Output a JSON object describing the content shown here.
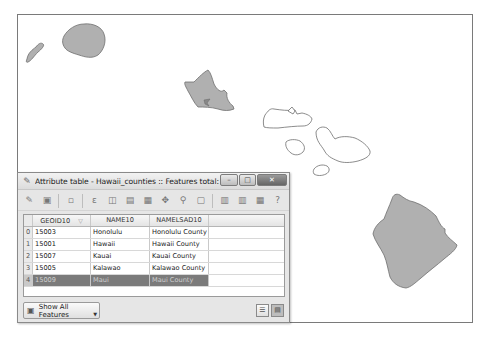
{
  "map": {
    "layer_name": "Hawaii_counties",
    "fill_color": "#b0b0b0",
    "selected_fill_color": "#ffffff",
    "outline_color": "#6e6e6e",
    "islands": [
      {
        "name": "Niihau",
        "selected": false
      },
      {
        "name": "Kauai",
        "selected": false
      },
      {
        "name": "Oahu",
        "selected": false
      },
      {
        "name": "Molokai",
        "selected": true
      },
      {
        "name": "Lanai",
        "selected": true
      },
      {
        "name": "Maui",
        "selected": true
      },
      {
        "name": "Kahoolawe",
        "selected": true
      },
      {
        "name": "Hawaii",
        "selected": false
      }
    ]
  },
  "attribute_window": {
    "title": "Attribute table - Hawaii_counties :: Features total: 5, filtere...",
    "title_icon": "pencil-table-icon",
    "controls": {
      "minimize": "–",
      "maximize": "□",
      "close": "✕"
    },
    "toolbar": [
      {
        "name": "toggle-editing",
        "glyph": "✎"
      },
      {
        "name": "save-edits",
        "glyph": "▣"
      },
      {
        "sep": true
      },
      {
        "name": "delete-selected",
        "glyph": "▫"
      },
      {
        "sep": true
      },
      {
        "name": "expression-select",
        "glyph": "ε"
      },
      {
        "name": "deselect-all",
        "glyph": "◫"
      },
      {
        "name": "move-selection-top",
        "glyph": "▤"
      },
      {
        "name": "invert-selection",
        "glyph": "▦"
      },
      {
        "name": "pan-to-selected",
        "glyph": "✥"
      },
      {
        "name": "zoom-to-selected",
        "glyph": "⚲"
      },
      {
        "name": "copy-selected",
        "glyph": "▢"
      },
      {
        "sep": true
      },
      {
        "name": "new-column",
        "glyph": "▥"
      },
      {
        "name": "delete-column",
        "glyph": "▥"
      },
      {
        "name": "field-calculator",
        "glyph": "▦"
      },
      {
        "name": "help",
        "glyph": "?"
      }
    ],
    "table": {
      "columns": [
        "GEOID10",
        "NAME10",
        "NAMELSAD10"
      ],
      "rows": [
        {
          "index": "0",
          "GEOID10": "15003",
          "NAME10": "Honolulu",
          "NAMELSAD10": "Honolulu County",
          "selected": false
        },
        {
          "index": "1",
          "GEOID10": "15001",
          "NAME10": "Hawaii",
          "NAMELSAD10": "Hawaii County",
          "selected": false
        },
        {
          "index": "2",
          "GEOID10": "15007",
          "NAME10": "Kauai",
          "NAMELSAD10": "Kauai County",
          "selected": false
        },
        {
          "index": "3",
          "GEOID10": "15005",
          "NAME10": "Kalawao",
          "NAMELSAD10": "Kalawao County",
          "selected": false
        },
        {
          "index": "4",
          "GEOID10": "15009",
          "NAME10": "Maui",
          "NAMELSAD10": "Maui County",
          "selected": true
        }
      ]
    },
    "footer": {
      "filter_button_label": "Show All Features",
      "table_view_icon": "table-view-icon",
      "form_view_icon": "form-view-icon"
    }
  }
}
